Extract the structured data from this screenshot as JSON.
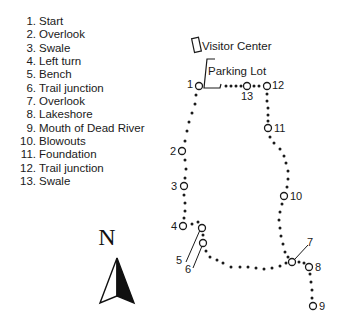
{
  "legend": {
    "items": [
      {
        "num": "1.",
        "label": "Start"
      },
      {
        "num": "2.",
        "label": "Overlook"
      },
      {
        "num": "3.",
        "label": "Swale"
      },
      {
        "num": "4.",
        "label": "Left turn"
      },
      {
        "num": "5.",
        "label": "Bench"
      },
      {
        "num": "6.",
        "label": "Trail junction"
      },
      {
        "num": "7.",
        "label": "Overlook"
      },
      {
        "num": "8.",
        "label": "Lakeshore"
      },
      {
        "num": "9.",
        "label": "Mouth of Dead River"
      },
      {
        "num": "10.",
        "label": "Blowouts"
      },
      {
        "num": "11.",
        "label": "Foundation"
      },
      {
        "num": "12.",
        "label": "Trail junction"
      },
      {
        "num": "13.",
        "label": "Swale"
      }
    ]
  },
  "map": {
    "landmarks": {
      "visitor_center": "Visitor Center",
      "parking_lot": "Parking Lot"
    },
    "stops": {
      "s1": "1",
      "s2": "2",
      "s3": "3",
      "s4": "4",
      "s5": "5",
      "s6": "6",
      "s7": "7",
      "s8": "8",
      "s9": "9",
      "s10": "10",
      "s11": "11",
      "s12": "12",
      "s13": "13"
    },
    "compass": {
      "label": "N"
    },
    "colors": {
      "ink": "#1a1a1a",
      "background": "#ffffff"
    }
  }
}
